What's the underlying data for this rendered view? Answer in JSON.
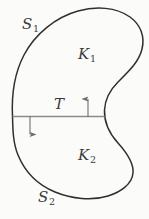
{
  "figure": {
    "type": "geometric-region-diagram",
    "background_color": "#fbfbfa",
    "outline_color": "#2f2f2f",
    "divider_color": "#8a8a8a",
    "arrow_color": "#6e6e6e",
    "label_color": "#3a3a3a",
    "labels": {
      "upper_boundary": {
        "base": "S",
        "sub": "1",
        "full": "S1"
      },
      "upper_region": {
        "base": "K",
        "sub": "1",
        "full": "K1"
      },
      "divider": {
        "base": "T",
        "sub": "",
        "full": "T"
      },
      "lower_region": {
        "base": "K",
        "sub": "2",
        "full": "K2"
      },
      "lower_boundary": {
        "base": "S",
        "sub": "2",
        "full": "S2"
      }
    },
    "geometry": {
      "outline_path": "M 12.5 116.5 C 11.5 96 14 74 24 55 C 35 34 56 17 78 11 C 96 6 116 7 130 17 C 141 25 145 37 142 49 C 139 62 128 72 118 82 C 110 90 105 99 104.5 110 C 104 122 109 133 118 143 C 127 153 134 163 133 173 C 132 184 121 192 108 196 C 92 201 72 199 55 192 C 38 185 25 172 18 155 C 13 143 12.8 129 12.5 116.5 Z",
      "divider_line": {
        "x1": 12.5,
        "y1": 116.5,
        "x2": 104.6,
        "y2": 116.5
      },
      "arrow_up": {
        "x": 88,
        "y_tail": 117,
        "y_head": 97,
        "direction": "up"
      },
      "arrow_down": {
        "x": 30,
        "y_tail": 116,
        "y_head": 137,
        "direction": "down"
      }
    }
  }
}
